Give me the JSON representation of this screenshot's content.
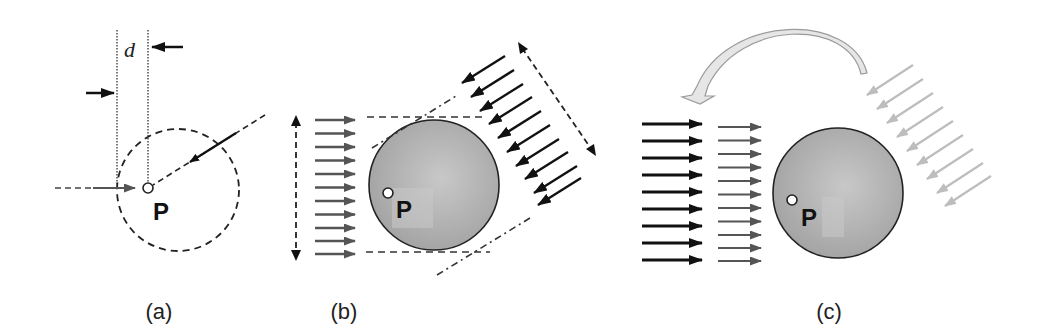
{
  "figure": {
    "panels": [
      {
        "id": "a",
        "caption": "(a)",
        "point_label": "P",
        "distance_label": "d",
        "elements": [
          "dotted-reference-lines",
          "dashed-circle",
          "incoming-horizontal-ray",
          "incoming-diagonal-ray",
          "distance-arrows"
        ]
      },
      {
        "id": "b",
        "caption": "(b)",
        "point_label": "P",
        "horizontal_arrow_count": 11,
        "diagonal_arrow_count": 10,
        "elements": [
          "sphere",
          "horizontal-parallel-rays",
          "diagonal-parallel-rays",
          "vertical-extent-double-arrow",
          "diagonal-extent-double-arrow",
          "tangent-dashed-lines"
        ]
      },
      {
        "id": "c",
        "caption": "(c)",
        "point_label": "P",
        "black_arrow_count": 9,
        "gray_arrow_count": 11,
        "light_arrow_count": 9,
        "elements": [
          "sphere",
          "black-parallel-rays",
          "gray-parallel-rays",
          "light-diagonal-rays",
          "curved-rotation-arrow"
        ]
      }
    ],
    "colors": {
      "ink": "#111111",
      "dark_gray_arrow": "#555555",
      "light_gray_arrow": "#bdbdbd",
      "sphere_fill": "#a9a9a9",
      "sphere_highlight": "#c4c4c4",
      "curved_arrow_fill": "#e6e6e6",
      "curved_arrow_stroke": "#9a9a9a"
    }
  }
}
